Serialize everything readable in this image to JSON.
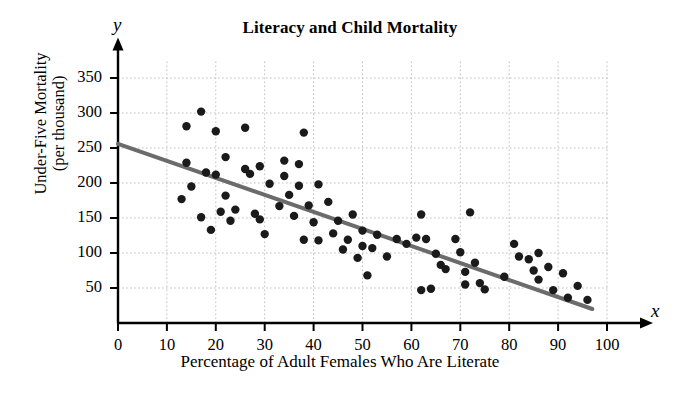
{
  "chart_data": {
    "type": "scatter",
    "title": "Literacy and Child Mortality",
    "xlabel": "Percentage of Adult Females Who Are Literate",
    "ylabel": "Under-Five Mortality\n(per thousand)",
    "ylabel_line1": "Under-Five Mortality",
    "ylabel_line2": "(per thousand)",
    "x_var_symbol": "x",
    "y_var_symbol": "y",
    "xlim": [
      0,
      100
    ],
    "ylim": [
      0,
      365
    ],
    "xticks": [
      0,
      10,
      20,
      30,
      40,
      50,
      60,
      70,
      80,
      90,
      100
    ],
    "yticks": [
      50,
      100,
      150,
      200,
      250,
      300,
      350
    ],
    "grid": true,
    "grid_style": "dotted",
    "grid_color": "#bfbfbf",
    "legend": "none",
    "point_color": "#1a1a1a",
    "point_radius": 4.2,
    "trendline": {
      "name": "least-squares regression line",
      "color": "#6b6b6b",
      "width": 4,
      "x_start": 0,
      "y_start": 256,
      "x_end": 97,
      "y_end": 20
    },
    "points": [
      {
        "x": 13,
        "y": 177
      },
      {
        "x": 14,
        "y": 281
      },
      {
        "x": 14,
        "y": 229
      },
      {
        "x": 15,
        "y": 195
      },
      {
        "x": 17,
        "y": 302
      },
      {
        "x": 17,
        "y": 151
      },
      {
        "x": 18,
        "y": 215
      },
      {
        "x": 19,
        "y": 133
      },
      {
        "x": 20,
        "y": 274
      },
      {
        "x": 20,
        "y": 212
      },
      {
        "x": 21,
        "y": 159
      },
      {
        "x": 22,
        "y": 237
      },
      {
        "x": 22,
        "y": 182
      },
      {
        "x": 23,
        "y": 146
      },
      {
        "x": 24,
        "y": 162
      },
      {
        "x": 26,
        "y": 279
      },
      {
        "x": 26,
        "y": 220
      },
      {
        "x": 27,
        "y": 213
      },
      {
        "x": 28,
        "y": 156
      },
      {
        "x": 29,
        "y": 224
      },
      {
        "x": 29,
        "y": 148
      },
      {
        "x": 30,
        "y": 127
      },
      {
        "x": 31,
        "y": 199
      },
      {
        "x": 33,
        "y": 167
      },
      {
        "x": 34,
        "y": 232
      },
      {
        "x": 34,
        "y": 210
      },
      {
        "x": 35,
        "y": 183
      },
      {
        "x": 36,
        "y": 153
      },
      {
        "x": 37,
        "y": 227
      },
      {
        "x": 37,
        "y": 196
      },
      {
        "x": 38,
        "y": 119
      },
      {
        "x": 38,
        "y": 272
      },
      {
        "x": 39,
        "y": 168
      },
      {
        "x": 40,
        "y": 144
      },
      {
        "x": 41,
        "y": 198
      },
      {
        "x": 41,
        "y": 118
      },
      {
        "x": 43,
        "y": 173
      },
      {
        "x": 44,
        "y": 128
      },
      {
        "x": 45,
        "y": 146
      },
      {
        "x": 46,
        "y": 105
      },
      {
        "x": 47,
        "y": 119
      },
      {
        "x": 48,
        "y": 155
      },
      {
        "x": 49,
        "y": 93
      },
      {
        "x": 50,
        "y": 132
      },
      {
        "x": 50,
        "y": 110
      },
      {
        "x": 51,
        "y": 68
      },
      {
        "x": 52,
        "y": 107
      },
      {
        "x": 53,
        "y": 126
      },
      {
        "x": 55,
        "y": 95
      },
      {
        "x": 57,
        "y": 120
      },
      {
        "x": 59,
        "y": 113
      },
      {
        "x": 61,
        "y": 122
      },
      {
        "x": 62,
        "y": 155
      },
      {
        "x": 62,
        "y": 47
      },
      {
        "x": 63,
        "y": 120
      },
      {
        "x": 64,
        "y": 49
      },
      {
        "x": 65,
        "y": 99
      },
      {
        "x": 66,
        "y": 83
      },
      {
        "x": 67,
        "y": 77
      },
      {
        "x": 69,
        "y": 120
      },
      {
        "x": 70,
        "y": 101
      },
      {
        "x": 71,
        "y": 73
      },
      {
        "x": 71,
        "y": 55
      },
      {
        "x": 72,
        "y": 158
      },
      {
        "x": 73,
        "y": 86
      },
      {
        "x": 74,
        "y": 57
      },
      {
        "x": 75,
        "y": 48
      },
      {
        "x": 79,
        "y": 66
      },
      {
        "x": 81,
        "y": 113
      },
      {
        "x": 82,
        "y": 95
      },
      {
        "x": 84,
        "y": 91
      },
      {
        "x": 85,
        "y": 75
      },
      {
        "x": 86,
        "y": 100
      },
      {
        "x": 86,
        "y": 62
      },
      {
        "x": 88,
        "y": 80
      },
      {
        "x": 89,
        "y": 47
      },
      {
        "x": 91,
        "y": 71
      },
      {
        "x": 92,
        "y": 36
      },
      {
        "x": 94,
        "y": 53
      },
      {
        "x": 96,
        "y": 33
      }
    ]
  }
}
